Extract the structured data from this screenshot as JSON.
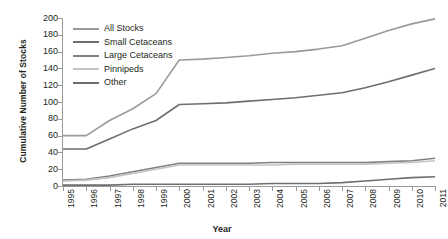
{
  "chart_data": {
    "type": "line",
    "title": "",
    "xlabel": "Year",
    "ylabel": "Cumulative Number of Stocks",
    "x": [
      1995,
      1996,
      1997,
      1998,
      1999,
      2000,
      2001,
      2002,
      2003,
      2004,
      2005,
      2006,
      2007,
      2008,
      2009,
      2010,
      2011
    ],
    "xtick_labels": [
      "1995",
      "1996",
      "1997",
      "1998",
      "1999",
      "2000",
      "2001",
      "2002",
      "2003",
      "2004",
      "2005",
      "2006",
      "2007",
      "2008",
      "2009",
      "2010",
      "2011"
    ],
    "ytick_labels": [
      "0",
      "20",
      "40",
      "60",
      "80",
      "100",
      "120",
      "140",
      "160",
      "180",
      "200"
    ],
    "ylim": [
      0,
      200
    ],
    "ytick_step": 20,
    "grid": false,
    "legend_position": "top-left",
    "series": [
      {
        "name": "All Stocks",
        "color": "#9a9a9a",
        "values": [
          60,
          60,
          78,
          92,
          110,
          150,
          151,
          153,
          155,
          158,
          160,
          163,
          167,
          176,
          185,
          193,
          199
        ]
      },
      {
        "name": "Small Cetaceans",
        "color": "#6e6e6e",
        "values": [
          44,
          44,
          56,
          68,
          78,
          97,
          98,
          99,
          101,
          103,
          105,
          108,
          111,
          117,
          124,
          132,
          140
        ]
      },
      {
        "name": "Large Cetaceans",
        "color": "#808080",
        "values": [
          7,
          8,
          12,
          17,
          22,
          27,
          27,
          27,
          27,
          28,
          28,
          28,
          28,
          28,
          29,
          30,
          33
        ]
      },
      {
        "name": "Pinnipeds",
        "color": "#c4c4c4",
        "values": [
          6,
          7,
          10,
          15,
          20,
          25,
          25,
          25,
          25,
          25,
          26,
          26,
          26,
          26,
          27,
          28,
          30
        ]
      },
      {
        "name": "Other",
        "color": "#6e6e6e",
        "values": [
          1,
          1,
          1,
          2,
          2,
          2,
          2,
          2,
          2,
          3,
          3,
          3,
          4,
          6,
          8,
          10,
          11
        ]
      }
    ]
  }
}
